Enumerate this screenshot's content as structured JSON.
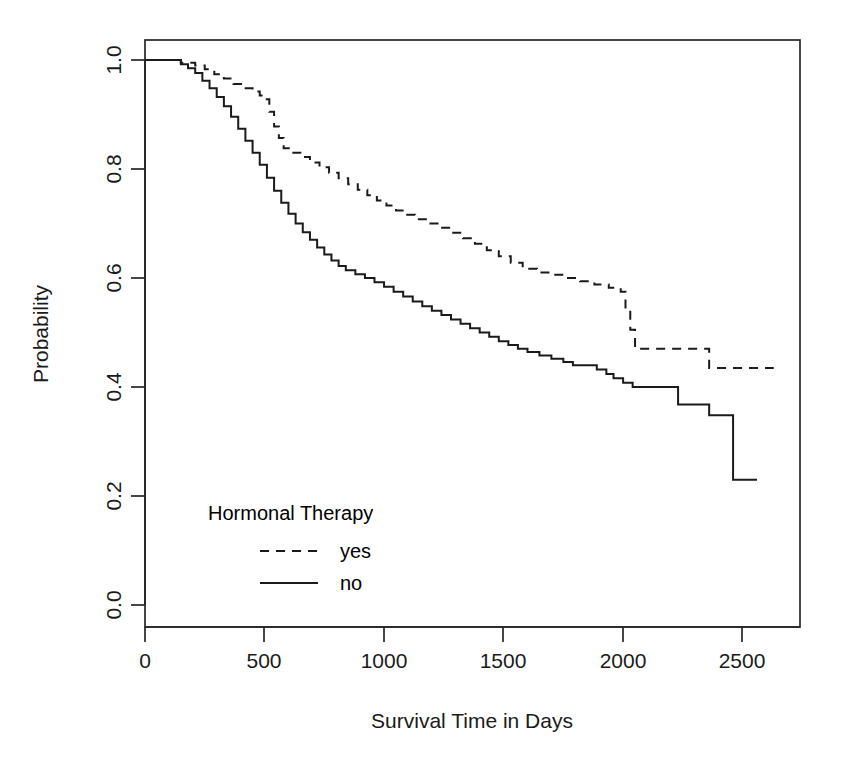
{
  "chart_data": {
    "type": "line",
    "subtype": "kaplan-meier-step",
    "title": "",
    "xlabel": "Survival Time in Days",
    "ylabel": "Probability",
    "xlim": [
      0,
      2740
    ],
    "ylim": [
      0.0,
      1.0
    ],
    "xticks": [
      0,
      500,
      1000,
      1500,
      2000,
      2500
    ],
    "xtick_labels": [
      "0",
      "500",
      "1000",
      "1500",
      "2000",
      "2500"
    ],
    "yticks": [
      0.0,
      0.2,
      0.4,
      0.6,
      0.8,
      1.0
    ],
    "ytick_labels": [
      "0.0",
      "0.2",
      "0.4",
      "0.6",
      "0.8",
      "1.0"
    ],
    "grid": false,
    "frame": true,
    "legend": {
      "title": "Hormonal Therapy",
      "position": "inside-lower-left",
      "entries": [
        {
          "label": "yes",
          "style": "dashed",
          "color": "#1a1a1a"
        },
        {
          "label": "no",
          "style": "solid",
          "color": "#1a1a1a"
        }
      ]
    },
    "series": [
      {
        "name": "yes",
        "style": "dashed",
        "color": "#1a1a1a",
        "points": [
          [
            0,
            1.0
          ],
          [
            100,
            1.0
          ],
          [
            150,
            0.995
          ],
          [
            210,
            0.99
          ],
          [
            250,
            0.983
          ],
          [
            290,
            0.974
          ],
          [
            330,
            0.966
          ],
          [
            370,
            0.956
          ],
          [
            410,
            0.948
          ],
          [
            450,
            0.942
          ],
          [
            480,
            0.935
          ],
          [
            500,
            0.928
          ],
          [
            520,
            0.905
          ],
          [
            540,
            0.878
          ],
          [
            560,
            0.857
          ],
          [
            580,
            0.838
          ],
          [
            610,
            0.83
          ],
          [
            650,
            0.822
          ],
          [
            690,
            0.812
          ],
          [
            730,
            0.803
          ],
          [
            770,
            0.793
          ],
          [
            810,
            0.783
          ],
          [
            850,
            0.772
          ],
          [
            890,
            0.762
          ],
          [
            930,
            0.752
          ],
          [
            970,
            0.742
          ],
          [
            1010,
            0.733
          ],
          [
            1050,
            0.724
          ],
          [
            1090,
            0.716
          ],
          [
            1130,
            0.708
          ],
          [
            1180,
            0.7
          ],
          [
            1230,
            0.692
          ],
          [
            1280,
            0.683
          ],
          [
            1330,
            0.673
          ],
          [
            1380,
            0.663
          ],
          [
            1430,
            0.651
          ],
          [
            1480,
            0.64
          ],
          [
            1530,
            0.628
          ],
          [
            1580,
            0.617
          ],
          [
            1640,
            0.61
          ],
          [
            1700,
            0.606
          ],
          [
            1760,
            0.6
          ],
          [
            1820,
            0.594
          ],
          [
            1880,
            0.588
          ],
          [
            1940,
            0.582
          ],
          [
            1990,
            0.575
          ],
          [
            2010,
            0.54
          ],
          [
            2030,
            0.505
          ],
          [
            2050,
            0.47
          ],
          [
            2340,
            0.47
          ],
          [
            2360,
            0.435
          ],
          [
            2630,
            0.435
          ]
        ]
      },
      {
        "name": "no",
        "style": "solid",
        "color": "#1a1a1a",
        "points": [
          [
            0,
            1.0
          ],
          [
            110,
            1.0
          ],
          [
            150,
            0.992
          ],
          [
            180,
            0.985
          ],
          [
            210,
            0.976
          ],
          [
            240,
            0.962
          ],
          [
            270,
            0.948
          ],
          [
            300,
            0.932
          ],
          [
            330,
            0.915
          ],
          [
            360,
            0.896
          ],
          [
            390,
            0.874
          ],
          [
            420,
            0.852
          ],
          [
            450,
            0.83
          ],
          [
            480,
            0.808
          ],
          [
            510,
            0.784
          ],
          [
            540,
            0.76
          ],
          [
            570,
            0.738
          ],
          [
            600,
            0.718
          ],
          [
            630,
            0.7
          ],
          [
            660,
            0.684
          ],
          [
            690,
            0.67
          ],
          [
            720,
            0.656
          ],
          [
            750,
            0.643
          ],
          [
            780,
            0.632
          ],
          [
            810,
            0.622
          ],
          [
            840,
            0.614
          ],
          [
            880,
            0.607
          ],
          [
            920,
            0.6
          ],
          [
            960,
            0.592
          ],
          [
            1000,
            0.584
          ],
          [
            1040,
            0.575
          ],
          [
            1080,
            0.566
          ],
          [
            1120,
            0.557
          ],
          [
            1160,
            0.548
          ],
          [
            1200,
            0.54
          ],
          [
            1240,
            0.532
          ],
          [
            1280,
            0.524
          ],
          [
            1320,
            0.516
          ],
          [
            1360,
            0.508
          ],
          [
            1400,
            0.5
          ],
          [
            1440,
            0.492
          ],
          [
            1480,
            0.484
          ],
          [
            1520,
            0.477
          ],
          [
            1560,
            0.47
          ],
          [
            1600,
            0.464
          ],
          [
            1650,
            0.458
          ],
          [
            1700,
            0.452
          ],
          [
            1750,
            0.446
          ],
          [
            1790,
            0.44
          ],
          [
            1860,
            0.44
          ],
          [
            1890,
            0.432
          ],
          [
            1930,
            0.424
          ],
          [
            1960,
            0.416
          ],
          [
            2000,
            0.408
          ],
          [
            2040,
            0.4
          ],
          [
            2200,
            0.4
          ],
          [
            2230,
            0.368
          ],
          [
            2330,
            0.368
          ],
          [
            2360,
            0.348
          ],
          [
            2450,
            0.348
          ],
          [
            2460,
            0.23
          ],
          [
            2560,
            0.23
          ]
        ]
      }
    ]
  }
}
